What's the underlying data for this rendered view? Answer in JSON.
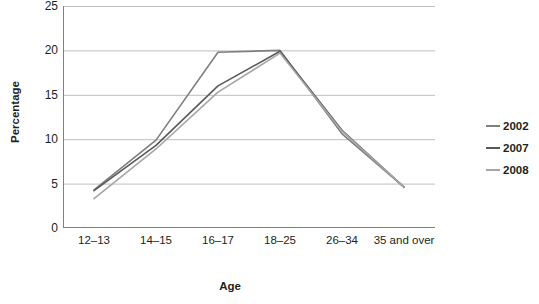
{
  "chart_data": {
    "type": "line",
    "title": "",
    "xlabel": "Age",
    "ylabel": "Percentage",
    "categories": [
      "12–13",
      "14–15",
      "16–17",
      "18–25",
      "26–34",
      "35 and over"
    ],
    "ylim": [
      0,
      25
    ],
    "yticks": [
      0,
      5,
      10,
      15,
      20,
      25
    ],
    "grid": true,
    "legend_position": "right",
    "series": [
      {
        "name": "2002",
        "color": "#7f7f7f",
        "values": [
          4.3,
          9.9,
          19.8,
          20.0,
          10.6,
          4.6
        ]
      },
      {
        "name": "2007",
        "color": "#595959",
        "values": [
          4.2,
          9.3,
          16.0,
          19.9,
          11.0,
          4.6
        ]
      },
      {
        "name": "2008",
        "color": "#a6a6a6",
        "values": [
          3.3,
          8.9,
          15.3,
          19.7,
          10.9,
          4.6
        ]
      }
    ]
  },
  "axes": {
    "y_title": "Percentage",
    "x_title": "Age",
    "y_tick_labels": [
      "25",
      "20",
      "15",
      "10",
      "5",
      "0"
    ],
    "x_tick_labels": [
      "12–13",
      "14–15",
      "16–17",
      "18–25",
      "35 and over"
    ]
  },
  "legend": {
    "items": [
      {
        "label": "2002",
        "color": "#7f7f7f"
      },
      {
        "label": "2007",
        "color": "#595959"
      },
      {
        "label": "2008",
        "color": "#a6a6a6"
      }
    ]
  },
  "colors": {
    "axis": "#808080",
    "grid": "#bfbfbf",
    "text": "#231f20",
    "background": "#ffffff"
  }
}
